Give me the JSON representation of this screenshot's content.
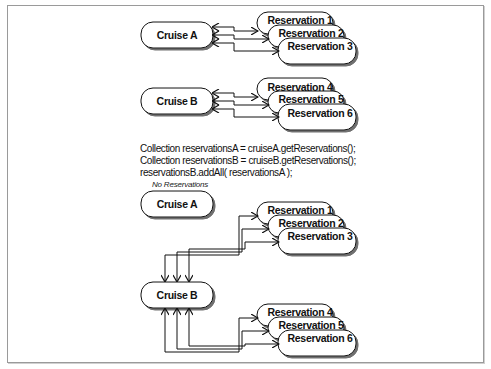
{
  "diagram": {
    "before": {
      "cruise_a": {
        "label": "Cruise A",
        "reservations": [
          "Reservation 1",
          "Reservation 2",
          "Reservation 3"
        ]
      },
      "cruise_b": {
        "label": "Cruise B",
        "reservations": [
          "Reservation 4",
          "Reservation 5",
          "Reservation 6"
        ]
      }
    },
    "code": {
      "line1": "Collection reservationsA = cruiseA.getReservations();",
      "line2": "Collection reservationsB = cruiseB.getReservations();",
      "line3": "reservationsB.addAll( reservationsA );"
    },
    "after": {
      "cruise_a": {
        "label": "Cruise A",
        "note": "No Reservations"
      },
      "cruise_b": {
        "label": "Cruise B",
        "reservations_group1": [
          "Reservation 1",
          "Reservation 2",
          "Reservation 3"
        ],
        "reservations_group2": [
          "Reservation 4",
          "Reservation 5",
          "Reservation 6"
        ]
      }
    }
  }
}
